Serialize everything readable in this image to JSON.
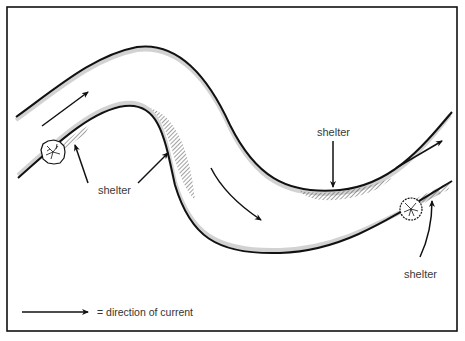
{
  "diagram": {
    "labels": [
      {
        "id": "shelter-left",
        "text": "shelter"
      },
      {
        "id": "shelter-top-right",
        "text": "shelter"
      },
      {
        "id": "shelter-bottom-right",
        "text": "shelter"
      }
    ],
    "legend": {
      "symbol": "arrow-right",
      "text": "= direction of current"
    },
    "colors": {
      "ink": "#111111",
      "hatch": "#555555",
      "bank_shading": "#bdbdbd",
      "label_text": "#3a3a3a",
      "background": "#ffffff"
    },
    "elements": {
      "river_banks": 2,
      "current_arrows": 4,
      "shelter_arrows": 4,
      "obstructions": [
        "bush-left",
        "bush-right"
      ]
    }
  }
}
